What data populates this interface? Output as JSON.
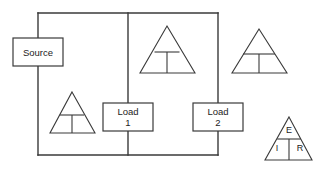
{
  "diagram": {
    "background_color": "#ffffff",
    "line_color": "#3a3a3a",
    "text_color": "#1c1c1c",
    "width": 317,
    "height": 171
  },
  "boxes": [
    {
      "id": "source",
      "name": "source-box",
      "lines": [
        "Source"
      ],
      "line1": "Source",
      "line2": "",
      "x": 13,
      "y": 38,
      "w": 50,
      "h": 28
    },
    {
      "id": "load1",
      "name": "load-1-box",
      "lines": [
        "Load",
        "1"
      ],
      "line1": "Load",
      "line2": "1",
      "x": 103,
      "y": 103,
      "w": 50,
      "h": 28
    },
    {
      "id": "load2",
      "name": "load-2-box",
      "lines": [
        "Load",
        "2"
      ],
      "line1": "Load",
      "line2": "2",
      "x": 193,
      "y": 103,
      "w": 50,
      "h": 28
    }
  ],
  "triangles": [
    {
      "id": "tri-lower-left",
      "name": "transformer-triangle-lower-left",
      "apex_x": 72,
      "apex_y": 92,
      "left_x": 50,
      "right_x": 95,
      "base_y": 133,
      "divider_y": 115,
      "labels": {
        "top": "",
        "bottom_left": "",
        "bottom_right": ""
      }
    },
    {
      "id": "tri-center",
      "name": "transformer-triangle-center",
      "apex_x": 167,
      "apex_y": 26,
      "left_x": 140,
      "right_x": 195,
      "base_y": 73,
      "divider_y": 52,
      "labels": {
        "top": "",
        "bottom_left": "",
        "bottom_right": ""
      }
    },
    {
      "id": "tri-top-right",
      "name": "transformer-triangle-top-right",
      "apex_x": 259,
      "apex_y": 29,
      "left_x": 232,
      "right_x": 287,
      "base_y": 73,
      "divider_y": 54,
      "labels": {
        "top": "",
        "bottom_left": "",
        "bottom_right": ""
      }
    },
    {
      "id": "tri-ohms-law",
      "name": "ohms-law-triangle",
      "apex_x": 289,
      "apex_y": 117,
      "left_x": 265,
      "right_x": 312,
      "base_y": 160,
      "divider_y": 139,
      "labels": {
        "top": "E",
        "bottom_left": "I",
        "bottom_right": "R"
      }
    }
  ],
  "wires": {
    "top_rail": {
      "name": "top-rail-wire",
      "x1": 38,
      "y1": 13,
      "x2": 218,
      "y2": 13
    },
    "bottom_rail": {
      "name": "bottom-rail-wire",
      "x1": 38,
      "y1": 155,
      "x2": 218,
      "y2": 155
    },
    "left_branch_upper": {
      "name": "left-branch-upper-wire",
      "x1": 38,
      "y1": 13,
      "x2": 38,
      "y2": 38
    },
    "left_branch_lower": {
      "name": "left-branch-lower-wire",
      "x1": 38,
      "y1": 66,
      "x2": 38,
      "y2": 155
    },
    "middle_branch_upper": {
      "name": "middle-branch-upper-wire",
      "x1": 128,
      "y1": 13,
      "x2": 128,
      "y2": 103
    },
    "middle_branch_lower": {
      "name": "middle-branch-lower-wire",
      "x1": 128,
      "y1": 131,
      "x2": 128,
      "y2": 155
    },
    "right_branch_upper": {
      "name": "right-branch-upper-wire",
      "x1": 218,
      "y1": 13,
      "x2": 218,
      "y2": 103
    },
    "right_branch_lower": {
      "name": "right-branch-lower-wire",
      "x1": 218,
      "y1": 131,
      "x2": 218,
      "y2": 155
    }
  },
  "ohms_law_legend": {
    "voltage_symbol": "E",
    "current_symbol": "I",
    "resistance_symbol": "R"
  }
}
